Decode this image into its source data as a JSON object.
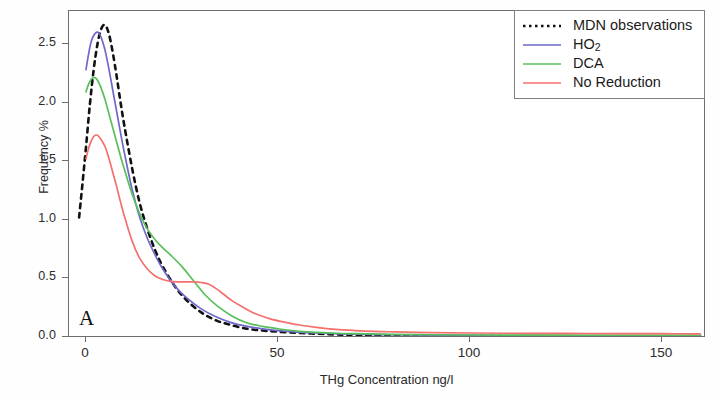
{
  "panel": {
    "label": "A"
  },
  "axes": {
    "xlabel": "THg Concentration ng/l",
    "ylabel": "Frequency %",
    "xticks": [
      "0",
      "50",
      "100",
      "150"
    ],
    "yticks": [
      "0.0",
      "0.5",
      "1.0",
      "1.5",
      "2.0",
      "2.5"
    ]
  },
  "legend": {
    "items": [
      {
        "label": "MDN observations",
        "color": "#111111",
        "style": "dotted"
      },
      {
        "label": "HO",
        "sub": "2",
        "color": "#6e68c8",
        "style": "solid"
      },
      {
        "label": "DCA",
        "color": "#58c05a",
        "style": "solid"
      },
      {
        "label": "No Reduction",
        "color": "#f4706e",
        "style": "solid"
      }
    ]
  },
  "colors": {
    "mdn": "#111111",
    "ho2": "#6e68c8",
    "dca": "#58c05a",
    "no_reduction": "#f4706e",
    "axis": "#6e6e6e",
    "text": "#2b2b2b",
    "legend_border": "#808080",
    "background": "#ffffff"
  },
  "chart_data": {
    "type": "line",
    "title": "",
    "subtitle": "",
    "xlabel": "THg Concentration ng/l",
    "ylabel": "Frequency %",
    "xlim": [
      0,
      160
    ],
    "ylim": [
      0.0,
      2.78
    ],
    "grid": false,
    "legend_position": "top-right",
    "annotations": [
      {
        "text": "A",
        "x": 3,
        "y": 0.12
      }
    ],
    "series": [
      {
        "name": "MDN observations",
        "color": "#111111",
        "style": "dotted",
        "x": [
          -1.8,
          -1.0,
          0.0,
          1.0,
          2.0,
          3.0,
          4.0,
          5.0,
          6.0,
          7.0,
          8.0,
          9.0,
          10.0,
          12.0,
          14.0,
          16.0,
          18.0,
          20.0,
          23.0,
          26.0,
          30.0,
          34.0,
          38.0,
          42.0,
          46.0,
          50.0,
          55.0,
          60.0,
          65.0,
          70.0,
          80.0,
          100.0,
          120.0,
          140.0,
          160.0
        ],
        "y": [
          1.02,
          1.28,
          1.62,
          1.98,
          2.28,
          2.5,
          2.63,
          2.66,
          2.58,
          2.42,
          2.22,
          2.0,
          1.8,
          1.44,
          1.14,
          0.92,
          0.74,
          0.6,
          0.44,
          0.32,
          0.21,
          0.14,
          0.1,
          0.07,
          0.055,
          0.045,
          0.035,
          0.028,
          0.022,
          0.018,
          0.012,
          0.008,
          0.006,
          0.005,
          0.004
        ]
      },
      {
        "name": "HO2",
        "color": "#6e68c8",
        "style": "solid",
        "x": [
          0.0,
          0.6,
          1.2,
          1.8,
          2.4,
          3.0,
          3.6,
          4.2,
          5.0,
          6.0,
          7.0,
          8.0,
          9.0,
          10.0,
          12.0,
          14.0,
          16.0,
          18.0,
          20.0,
          23.0,
          26.0,
          30.0,
          34.0,
          38.0,
          42.0,
          46.0,
          50.0,
          55.0,
          60.0,
          65.0,
          70.0,
          80.0,
          90.0,
          100.0,
          110.0,
          120.0,
          130.0,
          140.0,
          150.0,
          160.0
        ],
        "y": [
          2.28,
          2.4,
          2.5,
          2.56,
          2.59,
          2.6,
          2.58,
          2.53,
          2.44,
          2.28,
          2.1,
          1.92,
          1.74,
          1.57,
          1.26,
          1.02,
          0.84,
          0.7,
          0.58,
          0.44,
          0.34,
          0.24,
          0.17,
          0.12,
          0.09,
          0.07,
          0.055,
          0.042,
          0.034,
          0.028,
          0.024,
          0.019,
          0.016,
          0.014,
          0.013,
          0.013,
          0.012,
          0.012,
          0.012,
          0.012
        ]
      },
      {
        "name": "DCA",
        "color": "#58c05a",
        "style": "solid",
        "x": [
          0.0,
          0.6,
          1.2,
          1.8,
          2.4,
          3.0,
          3.6,
          4.2,
          5.0,
          6.0,
          7.0,
          8.0,
          9.0,
          10.0,
          12.0,
          14.0,
          16.0,
          18.0,
          20.0,
          22.0,
          25.0,
          28.0,
          31.0,
          34.0,
          38.0,
          42.0,
          46.0,
          50.0,
          55.0,
          60.0,
          65.0,
          70.0,
          80.0,
          90.0,
          100.0,
          110.0,
          120.0,
          130.0,
          140.0,
          150.0,
          160.0
        ],
        "y": [
          2.09,
          2.15,
          2.19,
          2.21,
          2.21,
          2.19,
          2.15,
          2.1,
          2.02,
          1.9,
          1.78,
          1.66,
          1.54,
          1.43,
          1.22,
          1.05,
          0.92,
          0.83,
          0.76,
          0.7,
          0.6,
          0.48,
          0.36,
          0.27,
          0.18,
          0.12,
          0.09,
          0.07,
          0.05,
          0.04,
          0.032,
          0.028,
          0.022,
          0.019,
          0.017,
          0.016,
          0.016,
          0.015,
          0.015,
          0.014,
          0.014
        ]
      },
      {
        "name": "No Reduction",
        "color": "#f4706e",
        "style": "solid",
        "x": [
          0.0,
          0.6,
          1.2,
          1.8,
          2.4,
          3.0,
          3.6,
          4.2,
          5.0,
          6.0,
          7.0,
          8.0,
          9.0,
          10.0,
          12.0,
          14.0,
          16.0,
          18.0,
          20.0,
          22.0,
          24.0,
          26.0,
          28.0,
          30.0,
          32.0,
          34.0,
          36.0,
          38.0,
          40.0,
          44.0,
          48.0,
          52.0,
          56.0,
          60.0,
          65.0,
          70.0,
          75.0,
          80.0,
          90.0,
          100.0,
          110.0,
          120.0,
          130.0,
          140.0,
          150.0,
          160.0
        ],
        "y": [
          1.52,
          1.6,
          1.66,
          1.7,
          1.72,
          1.72,
          1.7,
          1.67,
          1.62,
          1.52,
          1.4,
          1.28,
          1.15,
          1.03,
          0.82,
          0.67,
          0.58,
          0.52,
          0.49,
          0.475,
          0.47,
          0.47,
          0.47,
          0.465,
          0.45,
          0.41,
          0.36,
          0.31,
          0.27,
          0.2,
          0.155,
          0.125,
          0.1,
          0.082,
          0.065,
          0.055,
          0.048,
          0.044,
          0.038,
          0.034,
          0.032,
          0.031,
          0.03,
          0.029,
          0.028,
          0.027
        ]
      }
    ]
  }
}
